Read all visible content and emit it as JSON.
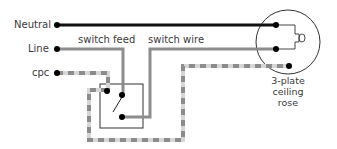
{
  "labels": {
    "neutral": "Neutral",
    "line": "Line",
    "cpc": "cpc",
    "switch_feed": "switch feed",
    "switch_wire": "switch wire",
    "rose_line1": "3-plate",
    "rose_line2": "ceiling",
    "rose_line3": "rose"
  },
  "colors": {
    "neutral_wire": "#111111",
    "live_wire": "#8c8c8c",
    "cpc_dash_a": "#8c8c8c",
    "cpc_dash_b": "#d4d4d4",
    "outline": "#333333",
    "terminal": "#000000"
  }
}
